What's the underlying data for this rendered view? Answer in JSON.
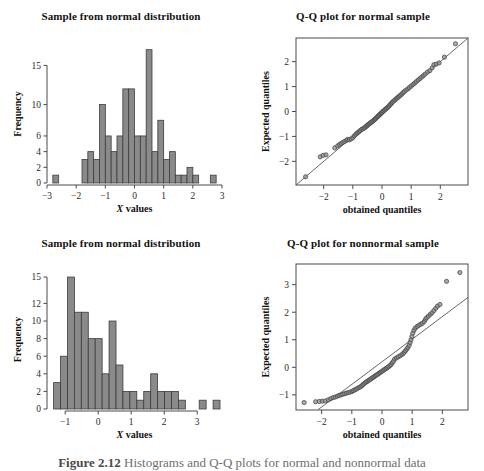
{
  "figure": {
    "caption_number": "Figure 2.12",
    "caption_text": "Histograms and Q-Q plots for normal and nonnormal data",
    "background": "#ffffff",
    "bar_fill": "#8a8a8a",
    "bar_stroke": "#3c3c3c",
    "marker_fill": "#8f8f8f",
    "marker_stroke": "#4a4a4a",
    "axis_color": "#4a4a4a",
    "line_color": "#555555"
  },
  "chart_data": [
    {
      "id": "hist-normal",
      "type": "bar",
      "title": "Sample from normal distribution",
      "xlabel": "X values",
      "ylabel": "Frequency",
      "xlim": [
        -3,
        3
      ],
      "ylim": [
        0,
        17.6
      ],
      "xticks": [
        -3,
        -2,
        -1,
        0,
        1,
        2,
        3
      ],
      "xticklabels": [
        "−3",
        "−2",
        "−1",
        "0",
        "1",
        "2",
        "3"
      ],
      "yticks": [
        0,
        2,
        4,
        6,
        10,
        15
      ],
      "yticklabels": [
        "0",
        "2",
        "4",
        "6",
        "10",
        "15"
      ],
      "grid": false,
      "bin_width": 0.2,
      "bin_edges": [
        -2.8,
        -2.6,
        -1.8,
        -1.6,
        -1.4,
        -1.2,
        -1.0,
        -0.8,
        -0.6,
        -0.4,
        -0.2,
        0.0,
        0.2,
        0.4,
        0.6,
        0.8,
        1.0,
        1.2,
        1.4,
        1.6,
        1.8,
        2.0,
        2.2,
        2.6,
        2.8
      ],
      "bars": [
        {
          "x0": -2.8,
          "x1": -2.6,
          "value": 1
        },
        {
          "x0": -1.8,
          "x1": -1.6,
          "value": 3
        },
        {
          "x0": -1.6,
          "x1": -1.4,
          "value": 4
        },
        {
          "x0": -1.4,
          "x1": -1.2,
          "value": 3
        },
        {
          "x0": -1.2,
          "x1": -1.0,
          "value": 10
        },
        {
          "x0": -1.0,
          "x1": -0.8,
          "value": 6
        },
        {
          "x0": -0.8,
          "x1": -0.6,
          "value": 4
        },
        {
          "x0": -0.6,
          "x1": -0.4,
          "value": 6
        },
        {
          "x0": -0.4,
          "x1": -0.2,
          "value": 12
        },
        {
          "x0": -0.2,
          "x1": 0.0,
          "value": 12
        },
        {
          "x0": 0.0,
          "x1": 0.2,
          "value": 6
        },
        {
          "x0": 0.2,
          "x1": 0.4,
          "value": 6
        },
        {
          "x0": 0.4,
          "x1": 0.6,
          "value": 17
        },
        {
          "x0": 0.6,
          "x1": 0.8,
          "value": 4
        },
        {
          "x0": 0.8,
          "x1": 1.0,
          "value": 8
        },
        {
          "x0": 1.0,
          "x1": 1.2,
          "value": 3
        },
        {
          "x0": 1.2,
          "x1": 1.4,
          "value": 4
        },
        {
          "x0": 1.4,
          "x1": 1.6,
          "value": 1
        },
        {
          "x0": 1.6,
          "x1": 1.8,
          "value": 1
        },
        {
          "x0": 1.8,
          "x1": 2.0,
          "value": 2
        },
        {
          "x0": 2.0,
          "x1": 2.2,
          "value": 1
        },
        {
          "x0": 2.6,
          "x1": 2.8,
          "value": 1
        }
      ]
    },
    {
      "id": "qq-normal",
      "type": "scatter",
      "title": "Q-Q plot for normal sample",
      "xlabel": "obtained quantiles",
      "ylabel": "Expected quantiles",
      "xlim": [
        -2.95,
        2.95
      ],
      "ylim": [
        -2.95,
        2.95
      ],
      "xticks": [
        -2,
        -1,
        0,
        1,
        2
      ],
      "xticklabels": [
        "−2",
        "−1",
        "0",
        "1",
        "2"
      ],
      "yticks": [
        -2,
        -1,
        0,
        1,
        2
      ],
      "yticklabels": [
        "−2",
        "−1",
        "0",
        "1",
        "2"
      ],
      "grid": false,
      "reference_line": {
        "slope": 1,
        "intercept": 0
      },
      "points": [
        [
          -2.62,
          -2.62
        ],
        [
          -2.12,
          -1.82
        ],
        [
          -2.02,
          -1.76
        ],
        [
          -1.92,
          -1.74
        ],
        [
          -1.62,
          -1.46
        ],
        [
          -1.52,
          -1.38
        ],
        [
          -1.46,
          -1.33
        ],
        [
          -1.4,
          -1.28
        ],
        [
          -1.34,
          -1.24
        ],
        [
          -1.28,
          -1.2
        ],
        [
          -1.22,
          -1.16
        ],
        [
          -1.18,
          -1.12
        ],
        [
          -1.12,
          -1.14
        ],
        [
          -1.06,
          -1.1
        ],
        [
          -1.0,
          -1.05
        ],
        [
          -0.95,
          -0.98
        ],
        [
          -0.9,
          -0.92
        ],
        [
          -0.86,
          -0.88
        ],
        [
          -0.82,
          -0.84
        ],
        [
          -0.78,
          -0.8
        ],
        [
          -0.74,
          -0.76
        ],
        [
          -0.7,
          -0.72
        ],
        [
          -0.66,
          -0.7
        ],
        [
          -0.62,
          -0.67
        ],
        [
          -0.58,
          -0.64
        ],
        [
          -0.55,
          -0.6
        ],
        [
          -0.52,
          -0.58
        ],
        [
          -0.5,
          -0.55
        ],
        [
          -0.47,
          -0.52
        ],
        [
          -0.44,
          -0.5
        ],
        [
          -0.41,
          -0.47
        ],
        [
          -0.38,
          -0.44
        ],
        [
          -0.35,
          -0.42
        ],
        [
          -0.32,
          -0.39
        ],
        [
          -0.29,
          -0.36
        ],
        [
          -0.26,
          -0.33
        ],
        [
          -0.23,
          -0.3
        ],
        [
          -0.21,
          -0.27
        ],
        [
          -0.18,
          -0.24
        ],
        [
          -0.15,
          -0.21
        ],
        [
          -0.13,
          -0.18
        ],
        [
          -0.1,
          -0.15
        ],
        [
          -0.07,
          -0.12
        ],
        [
          -0.05,
          -0.09
        ],
        [
          -0.02,
          -0.06
        ],
        [
          0.01,
          -0.03
        ],
        [
          0.03,
          0.0
        ],
        [
          0.06,
          0.03
        ],
        [
          0.09,
          0.06
        ],
        [
          0.12,
          0.09
        ],
        [
          0.15,
          0.12
        ],
        [
          0.18,
          0.15
        ],
        [
          0.21,
          0.18
        ],
        [
          0.24,
          0.22
        ],
        [
          0.27,
          0.26
        ],
        [
          0.3,
          0.3
        ],
        [
          0.33,
          0.34
        ],
        [
          0.36,
          0.38
        ],
        [
          0.4,
          0.42
        ],
        [
          0.44,
          0.46
        ],
        [
          0.48,
          0.5
        ],
        [
          0.52,
          0.54
        ],
        [
          0.56,
          0.58
        ],
        [
          0.6,
          0.62
        ],
        [
          0.64,
          0.66
        ],
        [
          0.68,
          0.7
        ],
        [
          0.72,
          0.75
        ],
        [
          0.76,
          0.8
        ],
        [
          0.82,
          0.85
        ],
        [
          0.88,
          0.9
        ],
        [
          0.94,
          0.96
        ],
        [
          1.0,
          1.02
        ],
        [
          1.06,
          1.08
        ],
        [
          1.12,
          1.14
        ],
        [
          1.18,
          1.2
        ],
        [
          1.24,
          1.26
        ],
        [
          1.3,
          1.32
        ],
        [
          1.36,
          1.38
        ],
        [
          1.42,
          1.44
        ],
        [
          1.48,
          1.5
        ],
        [
          1.56,
          1.58
        ],
        [
          1.64,
          1.64
        ],
        [
          1.72,
          1.75
        ],
        [
          1.78,
          1.88
        ],
        [
          1.86,
          1.9
        ],
        [
          1.96,
          1.95
        ],
        [
          2.14,
          2.18
        ],
        [
          2.52,
          2.72
        ]
      ]
    },
    {
      "id": "hist-nonnormal",
      "type": "bar",
      "title": "Sample from normal distribution",
      "xlabel": "X values",
      "ylabel": "Frequency",
      "xlim": [
        -1.55,
        3.75
      ],
      "ylim": [
        0,
        15.8
      ],
      "xticks": [
        -1,
        0,
        1,
        2,
        3
      ],
      "xticklabels": [
        "−1",
        "0",
        "1",
        "2",
        "3"
      ],
      "yticks": [
        0,
        2,
        4,
        6,
        8,
        10,
        12,
        15
      ],
      "yticklabels": [
        "0",
        "2",
        "4",
        "6",
        "8",
        "10",
        "12",
        "15"
      ],
      "grid": false,
      "bin_width": 0.21,
      "bars": [
        {
          "x0": -1.35,
          "x1": -1.14,
          "value": 3
        },
        {
          "x0": -1.14,
          "x1": -0.93,
          "value": 6
        },
        {
          "x0": -0.93,
          "x1": -0.72,
          "value": 15
        },
        {
          "x0": -0.72,
          "x1": -0.51,
          "value": 11
        },
        {
          "x0": -0.51,
          "x1": -0.3,
          "value": 11
        },
        {
          "x0": -0.3,
          "x1": -0.09,
          "value": 8
        },
        {
          "x0": -0.09,
          "x1": 0.12,
          "value": 8
        },
        {
          "x0": 0.12,
          "x1": 0.33,
          "value": 4
        },
        {
          "x0": 0.33,
          "x1": 0.54,
          "value": 10
        },
        {
          "x0": 0.54,
          "x1": 0.75,
          "value": 5
        },
        {
          "x0": 0.75,
          "x1": 0.96,
          "value": 2
        },
        {
          "x0": 0.96,
          "x1": 1.17,
          "value": 2
        },
        {
          "x0": 1.17,
          "x1": 1.38,
          "value": 1
        },
        {
          "x0": 1.38,
          "x1": 1.59,
          "value": 2
        },
        {
          "x0": 1.59,
          "x1": 1.8,
          "value": 4
        },
        {
          "x0": 1.8,
          "x1": 2.01,
          "value": 2
        },
        {
          "x0": 2.01,
          "x1": 2.22,
          "value": 2
        },
        {
          "x0": 2.22,
          "x1": 2.43,
          "value": 2
        },
        {
          "x0": 2.43,
          "x1": 2.64,
          "value": 1
        },
        {
          "x0": 3.06,
          "x1": 3.27,
          "value": 1
        },
        {
          "x0": 3.48,
          "x1": 3.69,
          "value": 1
        }
      ]
    },
    {
      "id": "qq-nonnormal",
      "type": "scatter",
      "title": "Q-Q plot for nonnormal sample",
      "xlabel": "obtained quantiles",
      "ylabel": "Expected quantiles",
      "xlim": [
        -2.85,
        2.85
      ],
      "ylim": [
        -1.55,
        3.75
      ],
      "xticks": [
        -2,
        -1,
        0,
        1,
        2
      ],
      "xticklabels": [
        "−2",
        "−1",
        "0",
        "1",
        "2"
      ],
      "yticks": [
        -1,
        0,
        1,
        2,
        3
      ],
      "yticklabels": [
        "−1",
        "0",
        "1",
        "2",
        "3"
      ],
      "grid": false,
      "reference_line": {
        "slope": 0.82,
        "intercept": 0.2
      },
      "points": [
        [
          -2.58,
          -1.28
        ],
        [
          -2.2,
          -1.25
        ],
        [
          -2.08,
          -1.24
        ],
        [
          -1.98,
          -1.23
        ],
        [
          -1.88,
          -1.22
        ],
        [
          -1.78,
          -1.18
        ],
        [
          -1.7,
          -1.14
        ],
        [
          -1.62,
          -1.1
        ],
        [
          -1.55,
          -1.08
        ],
        [
          -1.48,
          -1.05
        ],
        [
          -1.42,
          -1.02
        ],
        [
          -1.36,
          -1.0
        ],
        [
          -1.3,
          -0.98
        ],
        [
          -1.24,
          -0.96
        ],
        [
          -1.18,
          -0.94
        ],
        [
          -1.12,
          -0.92
        ],
        [
          -1.06,
          -0.9
        ],
        [
          -1.0,
          -0.88
        ],
        [
          -0.95,
          -0.85
        ],
        [
          -0.9,
          -0.82
        ],
        [
          -0.85,
          -0.79
        ],
        [
          -0.8,
          -0.76
        ],
        [
          -0.75,
          -0.73
        ],
        [
          -0.7,
          -0.7
        ],
        [
          -0.66,
          -0.66
        ],
        [
          -0.62,
          -0.62
        ],
        [
          -0.58,
          -0.58
        ],
        [
          -0.54,
          -0.55
        ],
        [
          -0.5,
          -0.52
        ],
        [
          -0.46,
          -0.49
        ],
        [
          -0.42,
          -0.46
        ],
        [
          -0.38,
          -0.43
        ],
        [
          -0.34,
          -0.4
        ],
        [
          -0.3,
          -0.37
        ],
        [
          -0.26,
          -0.34
        ],
        [
          -0.22,
          -0.31
        ],
        [
          -0.18,
          -0.28
        ],
        [
          -0.14,
          -0.25
        ],
        [
          -0.1,
          -0.22
        ],
        [
          -0.06,
          -0.19
        ],
        [
          -0.02,
          -0.16
        ],
        [
          0.02,
          -0.13
        ],
        [
          0.06,
          -0.1
        ],
        [
          0.1,
          -0.07
        ],
        [
          0.14,
          -0.04
        ],
        [
          0.18,
          -0.01
        ],
        [
          0.22,
          0.02
        ],
        [
          0.26,
          0.06
        ],
        [
          0.3,
          0.1
        ],
        [
          0.34,
          0.16
        ],
        [
          0.38,
          0.22
        ],
        [
          0.42,
          0.3
        ],
        [
          0.48,
          0.34
        ],
        [
          0.54,
          0.38
        ],
        [
          0.6,
          0.42
        ],
        [
          0.66,
          0.46
        ],
        [
          0.7,
          0.5
        ],
        [
          0.74,
          0.55
        ],
        [
          0.78,
          0.6
        ],
        [
          0.82,
          0.66
        ],
        [
          0.86,
          0.72
        ],
        [
          0.9,
          0.8
        ],
        [
          0.93,
          0.9
        ],
        [
          0.96,
          1.0
        ],
        [
          0.99,
          1.12
        ],
        [
          1.02,
          1.24
        ],
        [
          1.06,
          1.34
        ],
        [
          1.1,
          1.42
        ],
        [
          1.16,
          1.48
        ],
        [
          1.22,
          1.52
        ],
        [
          1.28,
          1.56
        ],
        [
          1.34,
          1.6
        ],
        [
          1.4,
          1.66
        ],
        [
          1.44,
          1.74
        ],
        [
          1.48,
          1.8
        ],
        [
          1.54,
          1.86
        ],
        [
          1.6,
          1.92
        ],
        [
          1.66,
          1.98
        ],
        [
          1.72,
          2.06
        ],
        [
          1.78,
          2.14
        ],
        [
          1.84,
          2.22
        ],
        [
          1.92,
          2.28
        ],
        [
          2.14,
          3.12
        ],
        [
          2.58,
          3.44
        ]
      ]
    }
  ]
}
